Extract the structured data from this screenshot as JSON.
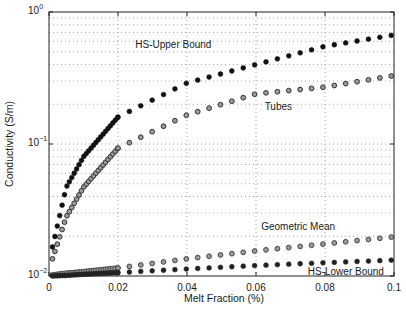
{
  "chart_data": {
    "type": "scatter",
    "title": "",
    "xlabel": "Melt Fraction (%)",
    "ylabel": "Conductivity (S/m)",
    "xlim": [
      0,
      0.1
    ],
    "ylim": [
      0.01,
      1
    ],
    "yscale": "log",
    "grid": true,
    "x_ticks": [
      "0",
      "0.02",
      "0.04",
      "0.06",
      "0.08",
      "0.1"
    ],
    "y_ticks": [
      {
        "base": "10",
        "exp": "0",
        "value": 1
      },
      {
        "base": "10",
        "exp": "−1",
        "value": 0.1
      },
      {
        "base": "10",
        "exp": "−2",
        "value": 0.01
      }
    ],
    "x": [
      0.001,
      0.005,
      0.01,
      0.02,
      0.04,
      0.06,
      0.08,
      0.1
    ],
    "series": [
      {
        "name": "HS-Upper Bound",
        "marker": "filled-circle",
        "color": "#111111",
        "values": [
          0.0166,
          0.047,
          0.08,
          0.16,
          0.29,
          0.4,
          0.55,
          0.67
        ]
      },
      {
        "name": "Tubes",
        "marker": "open-circle",
        "color": "#333333",
        "values": [
          0.0135,
          0.028,
          0.047,
          0.093,
          0.166,
          0.24,
          0.27,
          0.33
        ]
      },
      {
        "name": "Geometric Mean",
        "marker": "open-circle",
        "color": "#444444",
        "values": [
          0.0102,
          0.0105,
          0.0108,
          0.0115,
          0.0135,
          0.0155,
          0.0175,
          0.0198
        ]
      },
      {
        "name": "HS-Lower Bound",
        "marker": "filled-circle",
        "color": "#222222",
        "values": [
          0.01,
          0.0101,
          0.0103,
          0.0106,
          0.0113,
          0.012,
          0.0126,
          0.0132
        ]
      }
    ],
    "annotations": [
      {
        "text": "HS-Upper Bound",
        "x": 0.025,
        "y": 0.56
      },
      {
        "text": "Tubes",
        "x": 0.0625,
        "y": 0.19
      },
      {
        "text": "Geometric Mean",
        "x": 0.0615,
        "y": 0.0235
      },
      {
        "text": "HS-Lower Bound",
        "x": 0.075,
        "y": 0.0107
      }
    ]
  }
}
